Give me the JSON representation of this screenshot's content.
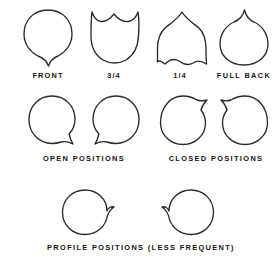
{
  "sheet": {
    "background_color": "#ffffff",
    "ink_color": "#2a2a2a",
    "width": 280,
    "height": 267,
    "kind": "line-art-reference-chart",
    "subject": "head shape orientations with directional point"
  },
  "rows": [
    {
      "id": "row-orientations",
      "figures": [
        {
          "id": "front",
          "label": "FRONT",
          "point_direction": "down",
          "description": "oval head with single downward point at bottom"
        },
        {
          "id": "three-quarter",
          "label": "3/4",
          "point_direction": "up-two-peaks",
          "description": "head with two upward peaks across the top and flat base"
        },
        {
          "id": "one-quarter",
          "label": "1/4",
          "point_direction": "up-single-peak",
          "description": "domed head with single top peak and wavy base"
        },
        {
          "id": "full-back",
          "label": "FULL BACK",
          "point_direction": "up",
          "description": "circle with single point at top"
        }
      ]
    },
    {
      "id": "row-open-closed",
      "groups": [
        {
          "id": "open-positions",
          "label": "OPEN  POSITIONS",
          "figures": [
            {
              "id": "open-left",
              "point_direction": "down-right",
              "description": "circle with point at lower right"
            },
            {
              "id": "open-right",
              "point_direction": "down-left",
              "description": "circle with point at lower left"
            }
          ]
        },
        {
          "id": "closed-positions",
          "label": "CLOSED  POSITIONS",
          "figures": [
            {
              "id": "closed-left",
              "point_direction": "up-right",
              "description": "circle with point at upper right"
            },
            {
              "id": "closed-right",
              "point_direction": "up-left",
              "description": "circle with point at upper left"
            }
          ]
        }
      ]
    },
    {
      "id": "row-profile",
      "group": {
        "id": "profile-positions",
        "label": "PROFILE  POSITIONS  (LESS FREQUENT)",
        "figures": [
          {
            "id": "profile-right",
            "point_direction": "right",
            "description": "circle with point projecting to the right"
          },
          {
            "id": "profile-left",
            "point_direction": "left",
            "description": "circle with point projecting to the left"
          }
        ]
      }
    }
  ]
}
